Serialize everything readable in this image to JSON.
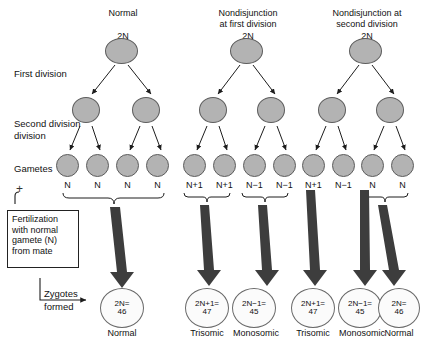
{
  "figure": {
    "row_labels": {
      "first_division": "First division",
      "second_division": "Second division",
      "gametes": "Gametes",
      "plus": "+",
      "zygotes_line1": "Zygotes",
      "zygotes_line2": "formed"
    },
    "fertilization_box": {
      "line1": "Fertilization",
      "line2": "with normal",
      "line3": "gamete (N)",
      "line4": "from mate"
    },
    "colors": {
      "cell_fill": "#b3b3b3",
      "cell_stroke": "#5d5d5d",
      "zygote_fill": "#fbfbfb",
      "zygote_stroke": "#6a6a6a",
      "arrow_fill": "#3d3d3d",
      "chromosome": "#111111",
      "background": "#ffffff"
    }
  },
  "columns": [
    {
      "id": "normal",
      "header_lines": [
        "Normal"
      ],
      "ploidy_label": "2N",
      "first_division_cells": [
        {
          "content": "H",
          "chromosomes": 1
        },
        {
          "content": "H",
          "chromosomes": 1
        }
      ],
      "gametes": [
        {
          "label": "N",
          "chromosomes": 1
        },
        {
          "label": "N",
          "chromosomes": 1
        },
        {
          "label": "N",
          "chromosomes": 1
        },
        {
          "label": "N",
          "chromosomes": 1
        }
      ],
      "braces": [
        {
          "span": [
            0,
            3
          ]
        }
      ],
      "zygotes": [
        {
          "line1": "2N=",
          "line2": "46",
          "outcome": "Normal"
        }
      ]
    },
    {
      "id": "nondisjunction-first-division",
      "header_lines": [
        "Nondisjunction",
        "at first division"
      ],
      "ploidy_label": "2N",
      "first_division_cells": [
        {
          "content": "HH",
          "chromosomes": 2
        },
        {
          "content": "empty",
          "chromosomes": 0
        }
      ],
      "gametes": [
        {
          "label": "N+1",
          "chromosomes": 2
        },
        {
          "label": "N+1",
          "chromosomes": 2
        },
        {
          "label": "N−1",
          "chromosomes": 0
        },
        {
          "label": "N−1",
          "chromosomes": 0
        }
      ],
      "braces": [
        {
          "span": [
            0,
            1
          ]
        },
        {
          "span": [
            2,
            3
          ]
        }
      ],
      "zygotes": [
        {
          "line1": "2N+1=",
          "line2": "47",
          "outcome": "Trisomic"
        },
        {
          "line1": "2N−1=",
          "line2": "45",
          "outcome": "Monosomic"
        }
      ]
    },
    {
      "id": "nondisjunction-second-division",
      "header_lines": [
        "Nondisjunction at",
        "second division"
      ],
      "ploidy_label": "2N",
      "first_division_cells": [
        {
          "content": "H",
          "chromosomes": 1
        },
        {
          "content": "H",
          "chromosomes": 1
        }
      ],
      "gametes": [
        {
          "label": "N+1",
          "chromosomes": 2
        },
        {
          "label": "N−1",
          "chromosomes": 0
        },
        {
          "label": "N",
          "chromosomes": 1
        },
        {
          "label": "N",
          "chromosomes": 1
        }
      ],
      "braces": [
        {
          "span": [
            2,
            3
          ]
        }
      ],
      "zygotes": [
        {
          "line1": "2N+1=",
          "line2": "47",
          "outcome": "Trisomic"
        },
        {
          "line1": "2N−1=",
          "line2": "45",
          "outcome": "Monosomic"
        },
        {
          "line1": "2N=",
          "line2": "46",
          "outcome": "Normal"
        }
      ]
    }
  ]
}
